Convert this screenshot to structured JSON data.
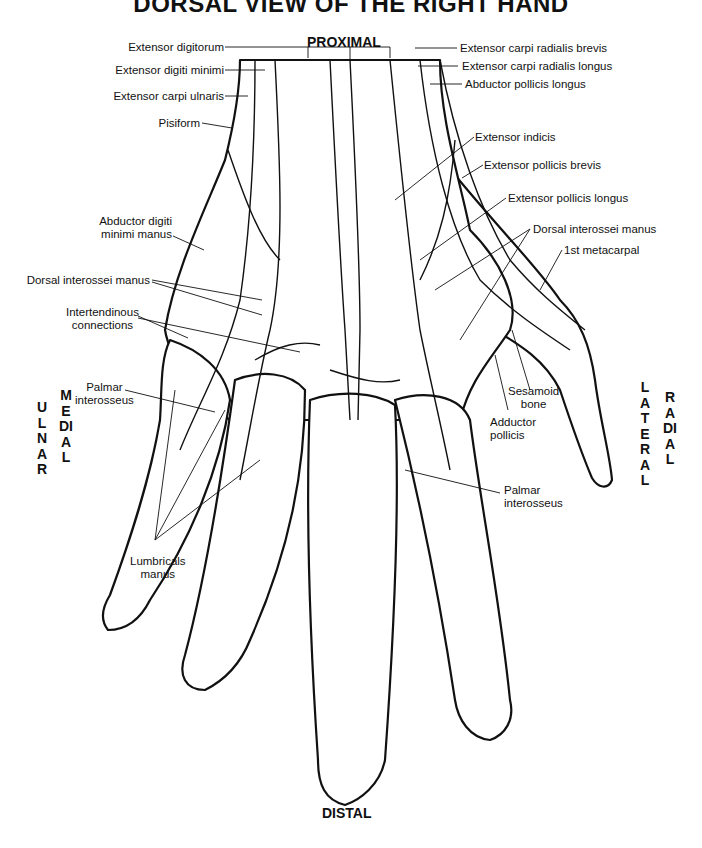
{
  "title": "DORSAL VIEW OF THE RIGHT HAND",
  "orientation": {
    "top": "PROXIMAL",
    "bottom": "DISTAL",
    "left_outer": "ULNAR",
    "left_inner": "MEDIAL",
    "right_inner": "LATERAL",
    "right_outer": "RADIAL"
  },
  "labels_left": [
    {
      "id": "extensor-digitorum",
      "text": "Extensor digitorum"
    },
    {
      "id": "extensor-digiti-minimi",
      "text": "Extensor digiti minimi"
    },
    {
      "id": "extensor-carpi-ulnaris",
      "text": "Extensor carpi ulnaris"
    },
    {
      "id": "pisiform",
      "text": "Pisiform"
    },
    {
      "id": "abductor-digiti-minimi-manus",
      "line1": "Abductor digiti",
      "line2": "minimi manus"
    },
    {
      "id": "dorsal-interossei-manus-left",
      "text": "Dorsal interossei manus"
    },
    {
      "id": "intertendinous-connections",
      "line1": "Intertendinous",
      "line2": "connections"
    },
    {
      "id": "palmar-interosseus-left",
      "line1": "Palmar",
      "line2": "interosseus"
    },
    {
      "id": "lumbricals-manus",
      "line1": "Lumbricals",
      "line2": "manus"
    }
  ],
  "labels_right": [
    {
      "id": "extensor-carpi-radialis-brevis",
      "text": "Extensor carpi radialis brevis"
    },
    {
      "id": "extensor-carpi-radialis-longus",
      "text": "Extensor carpi radialis longus"
    },
    {
      "id": "abductor-pollicis-longus",
      "text": "Abductor pollicis longus"
    },
    {
      "id": "extensor-indicis",
      "text": "Extensor indicis"
    },
    {
      "id": "extensor-pollicis-brevis",
      "text": "Extensor pollicis brevis"
    },
    {
      "id": "extensor-pollicis-longus",
      "text": "Extensor pollicis longus"
    },
    {
      "id": "dorsal-interossei-manus-right",
      "text": "Dorsal interossei manus"
    },
    {
      "id": "first-metacarpal",
      "text": "1st metacarpal"
    },
    {
      "id": "sesamoid-bone",
      "line1": "Sesamoid",
      "line2": "bone"
    },
    {
      "id": "adductor-pollicis",
      "line1": "Adductor",
      "line2": "pollicis"
    },
    {
      "id": "palmar-interosseus-right",
      "line1": "Palmar",
      "line2": "interosseus"
    }
  ]
}
